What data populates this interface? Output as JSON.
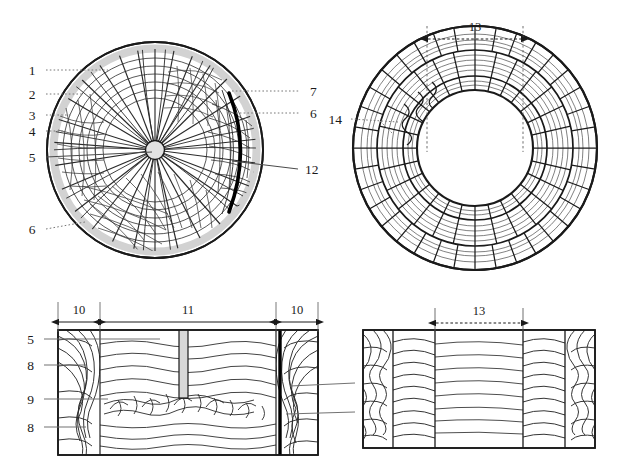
{
  "figure": {
    "type": "technical-diagram",
    "background_color": "#ffffff",
    "line_color": "#1a1a1a",
    "shade_color": "#d4d4d4",
    "hatch_color": "#6b6b6b",
    "accent_color": "#000000"
  },
  "panels": [
    {
      "id": "panel-top-left",
      "name": "radial-disc-section",
      "shape": "circle",
      "callouts": [
        {
          "id": "c1",
          "text": "1",
          "side": "left",
          "leader": "dotted"
        },
        {
          "id": "c2",
          "text": "2",
          "side": "left",
          "leader": "dotted"
        },
        {
          "id": "c3",
          "text": "3",
          "side": "left",
          "leader": "dotted"
        },
        {
          "id": "c4",
          "text": "4",
          "side": "left",
          "leader": "dotted"
        },
        {
          "id": "c5",
          "text": "5",
          "side": "left",
          "leader": "solid"
        },
        {
          "id": "c6l",
          "text": "6",
          "side": "left",
          "leader": "dotted"
        },
        {
          "id": "c7",
          "text": "7",
          "side": "right",
          "leader": "dotted"
        },
        {
          "id": "c6r",
          "text": "6",
          "side": "right",
          "leader": "dotted"
        },
        {
          "id": "c12",
          "text": "12",
          "side": "right",
          "leader": "solid"
        }
      ]
    },
    {
      "id": "panel-top-right",
      "name": "annular-ring-section",
      "shape": "annulus",
      "callouts": [
        {
          "id": "c14",
          "text": "14",
          "side": "left",
          "leader": "dotted"
        }
      ],
      "dimensions": [
        {
          "id": "d13",
          "text": "13",
          "style": "dotted-double-arrow"
        }
      ]
    },
    {
      "id": "panel-bottom-left",
      "name": "longitudinal-section-with-punch",
      "shape": "rectangle",
      "callouts": [
        {
          "id": "b5",
          "text": "5",
          "side": "left",
          "leader": "solid"
        },
        {
          "id": "b8a",
          "text": "8",
          "side": "left",
          "leader": "solid"
        },
        {
          "id": "b9",
          "text": "9",
          "side": "left",
          "leader": "solid"
        },
        {
          "id": "b8b",
          "text": "8",
          "side": "left",
          "leader": "solid"
        },
        {
          "id": "b12",
          "text": "12",
          "side": "right",
          "leader": "solid"
        },
        {
          "id": "b6",
          "text": "6",
          "side": "right",
          "leader": "solid"
        }
      ],
      "dimensions": [
        {
          "id": "d10a",
          "text": "10",
          "style": "solid-double-arrow"
        },
        {
          "id": "d11",
          "text": "11",
          "style": "solid-double-arrow"
        },
        {
          "id": "d10b",
          "text": "10",
          "style": "solid-double-arrow"
        }
      ]
    },
    {
      "id": "panel-bottom-right",
      "name": "ring-longitudinal-section",
      "shape": "rectangle",
      "callouts": [],
      "dimensions": [
        {
          "id": "d13b",
          "text": "13",
          "style": "dotted-double-arrow"
        }
      ]
    }
  ]
}
